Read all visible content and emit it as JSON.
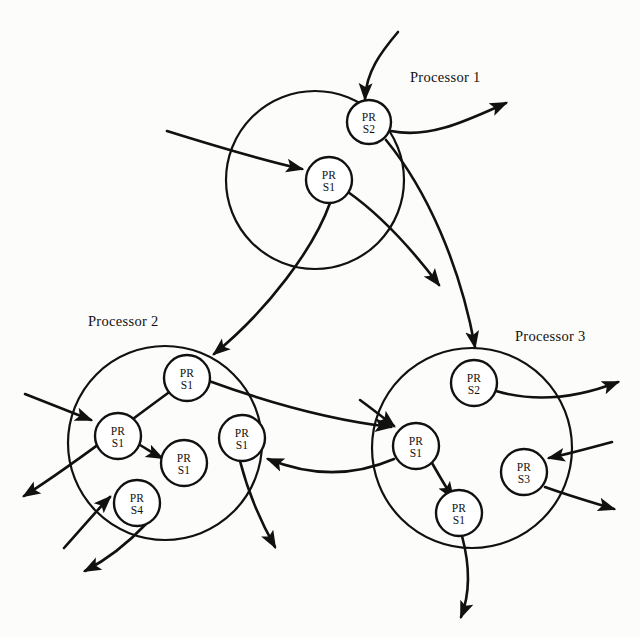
{
  "figure": {
    "title": "",
    "background": "#fcfcfa",
    "ink_color": "#111111"
  },
  "processors": [
    {
      "id": "processor-1",
      "label": "Processor 1",
      "label_x": 410,
      "label_y": 82,
      "cx": 315,
      "cy": 180,
      "r": 89,
      "nodes": [
        {
          "id": "p1-prs2",
          "line1": "PR",
          "line2": "S2",
          "cx": 369,
          "cy": 122,
          "r": 22
        },
        {
          "id": "p1-prs1",
          "line1": "PR",
          "line2": "S1",
          "cx": 329,
          "cy": 180,
          "r": 23
        }
      ]
    },
    {
      "id": "processor-2",
      "label": "Processor 2",
      "label_x": 88,
      "label_y": 326,
      "cx": 165,
      "cy": 443,
      "r": 97,
      "nodes": [
        {
          "id": "p2-prs1-top",
          "line1": "PR",
          "line2": "S1",
          "cx": 187,
          "cy": 378,
          "r": 23
        },
        {
          "id": "p2-prs1-left",
          "line1": "PR",
          "line2": "S1",
          "cx": 118,
          "cy": 436,
          "r": 23
        },
        {
          "id": "p2-prs1-center",
          "line1": "PR",
          "line2": "S1",
          "cx": 184,
          "cy": 463,
          "r": 23
        },
        {
          "id": "p2-prs1-right",
          "line1": "PR",
          "line2": "S1",
          "cx": 242,
          "cy": 438,
          "r": 23
        },
        {
          "id": "p2-prs4",
          "line1": "PR",
          "line2": "S4",
          "cx": 137,
          "cy": 503,
          "r": 23
        }
      ]
    },
    {
      "id": "processor-3",
      "label": "Processor 3",
      "label_x": 515,
      "label_y": 341,
      "cx": 472,
      "cy": 448,
      "r": 100,
      "nodes": [
        {
          "id": "p3-prs2",
          "line1": "PR",
          "line2": "S2",
          "cx": 474,
          "cy": 383,
          "r": 23
        },
        {
          "id": "p3-prs1-left",
          "line1": "PR",
          "line2": "S1",
          "cx": 416,
          "cy": 446,
          "r": 23
        },
        {
          "id": "p3-prs3",
          "line1": "PR",
          "line2": "S3",
          "cx": 524,
          "cy": 472,
          "r": 23
        },
        {
          "id": "p3-prs1-bottom",
          "line1": "PR",
          "line2": "S1",
          "cx": 459,
          "cy": 513,
          "r": 23
        }
      ]
    }
  ],
  "edges": [
    {
      "id": "in-to-p1-prs2",
      "d": "M 398 32 C 381 52 366 72 365 99",
      "arrow": true
    },
    {
      "id": "p1-prs2-out-right",
      "d": "M 391 131 C 430 139 468 120 506 103",
      "arrow": true
    },
    {
      "id": "in-to-p1-prs1",
      "d": "M 167 131 C 215 146 262 160 302 169",
      "arrow": true
    },
    {
      "id": "p1-prs1-to-p2-prs1",
      "d": "M 330 203 C 314 248 268 310 214 354",
      "arrow": true
    },
    {
      "id": "p1-prs1-out-down",
      "d": "M 348 192 C 382 216 414 252 439 285",
      "arrow": true
    },
    {
      "id": "p1-prs2-to-p3-prs2",
      "d": "M 386 140 C 427 190 460 265 475 347",
      "arrow": true
    },
    {
      "id": "p2-prs1-top-to-p3",
      "d": "M 209 381 C 272 404 330 420 391 427",
      "arrow": true
    },
    {
      "id": "p3-prs1-left-to-p2",
      "d": "M 394 459 C 345 480 300 472 268 459",
      "arrow": true
    },
    {
      "id": "in-to-p2-prs1-left",
      "d": "M 25 394 C 50 404 73 413 91 420",
      "arrow": true
    },
    {
      "id": "p2-prs1-left-to-center",
      "d": "M 140 445 C 150 451 156 455 162 458",
      "arrow": true
    },
    {
      "id": "p2-out-left-up",
      "d": "M 186 380 C 130 420 78 462 24 496",
      "arrow": true
    },
    {
      "id": "in-to-p2-prs4",
      "d": "M 64 548 C 82 528 98 509 110 497",
      "arrow": true
    },
    {
      "id": "p2-prs4-out-downleft",
      "d": "M 146 524 C 128 543 106 560 85 571",
      "arrow": true
    },
    {
      "id": "p2-prs1-right-out",
      "d": "M 240 461 C 248 492 262 524 275 547",
      "arrow": true
    },
    {
      "id": "in-to-p3-prs1-left",
      "d": "M 360 400 C 375 411 385 419 394 426",
      "arrow": true
    },
    {
      "id": "p3-prs1-left-to-bottom",
      "d": "M 432 463 C 440 477 447 489 453 498",
      "arrow": true
    },
    {
      "id": "p3-prs2-out-right",
      "d": "M 496 391 C 540 404 582 396 618 382",
      "arrow": true
    },
    {
      "id": "in-to-p3-prs3",
      "d": "M 612 442 C 590 448 568 454 549 458",
      "arrow": true
    },
    {
      "id": "p3-prs3-out-right",
      "d": "M 545 487 C 570 496 594 503 614 509",
      "arrow": true
    },
    {
      "id": "p3-prs1-bottom-out",
      "d": "M 462 536 C 470 566 470 594 461 617",
      "arrow": true
    }
  ],
  "legend": {
    "node_label_prefix": "PR",
    "node_states": [
      "S1",
      "S2",
      "S3",
      "S4"
    ]
  }
}
